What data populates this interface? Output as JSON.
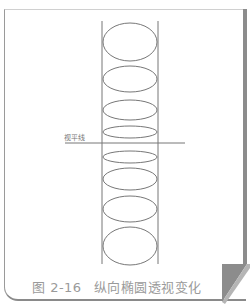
{
  "figure": {
    "number": "图 2-16",
    "title": "纵向椭圆透视变化",
    "horizon_label": "视平线"
  },
  "colors": {
    "line": "#777777",
    "caption": "#9a9a9a",
    "frame": "#8c8c8c"
  },
  "ellipses": [
    {
      "cy": 42,
      "rx": 27,
      "ry": 19
    },
    {
      "cy": 79,
      "rx": 27,
      "ry": 13
    },
    {
      "cy": 110,
      "rx": 27,
      "ry": 10
    },
    {
      "cy": 132,
      "rx": 27,
      "ry": 6
    },
    {
      "cy": 157,
      "rx": 27,
      "ry": 6
    },
    {
      "cy": 179,
      "rx": 27,
      "ry": 11
    },
    {
      "cy": 209,
      "rx": 27,
      "ry": 13
    },
    {
      "cy": 246,
      "rx": 27,
      "ry": 19
    }
  ]
}
